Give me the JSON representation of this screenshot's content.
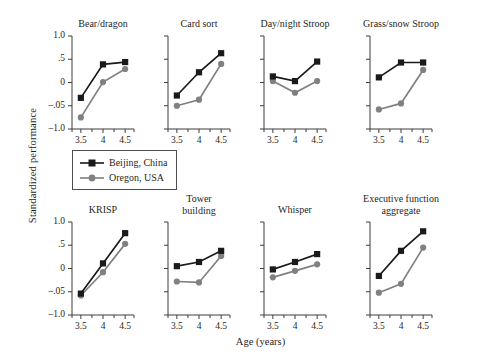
{
  "chart_data": {
    "type": "line",
    "title": "",
    "xlabel": "Age (years)",
    "ylabel": "Standardized performance",
    "x": [
      3.5,
      4,
      4.5
    ],
    "xtick_labels": [
      "3.5",
      "4",
      "4.5"
    ],
    "ytick_labels": [
      "1.0",
      ".5",
      "0",
      "–.05",
      "–1.0"
    ],
    "ytick_values": [
      1.0,
      0.5,
      0,
      -0.5,
      -1.0
    ],
    "ylim": [
      -1.0,
      1.0
    ],
    "xlim": [
      3.3,
      4.7
    ],
    "grid": false,
    "legend_position": "center-left",
    "series_names": [
      "Beijing, China",
      "Oregon, USA"
    ],
    "colors": {
      "beijing": "#1a1a1a",
      "oregon": "#808080",
      "axis": "#3d3d3d",
      "background": "#ffffff"
    },
    "markers": {
      "beijing": "square",
      "oregon": "circle"
    },
    "panels": [
      {
        "title": "Bear/dragon",
        "title_lines": [
          "Bear/dragon"
        ],
        "series": [
          {
            "name": "Beijing, China",
            "values": [
              -0.33,
              0.39,
              0.44
            ]
          },
          {
            "name": "Oregon, USA",
            "values": [
              -0.75,
              0.01,
              0.29
            ]
          }
        ]
      },
      {
        "title": "Card sort",
        "title_lines": [
          "Card sort"
        ],
        "series": [
          {
            "name": "Beijing, China",
            "values": [
              -0.28,
              0.22,
              0.63
            ]
          },
          {
            "name": "Oregon, USA",
            "values": [
              -0.5,
              -0.37,
              0.4
            ]
          }
        ]
      },
      {
        "title": "Day/night Stroop",
        "title_lines": [
          "Day/night Stroop"
        ],
        "series": [
          {
            "name": "Beijing, China",
            "values": [
              0.13,
              0.03,
              0.45
            ]
          },
          {
            "name": "Oregon, USA",
            "values": [
              0.03,
              -0.22,
              0.03
            ]
          }
        ]
      },
      {
        "title": "Grass/snow Stroop",
        "title_lines": [
          "Grass/snow Stroop"
        ],
        "series": [
          {
            "name": "Beijing, China",
            "values": [
              0.11,
              0.43,
              0.43
            ]
          },
          {
            "name": "Oregon, USA",
            "values": [
              -0.58,
              -0.45,
              0.27
            ]
          }
        ]
      },
      {
        "title": "KRISP",
        "title_lines": [
          "KRISP"
        ],
        "series": [
          {
            "name": "Beijing, China",
            "values": [
              -0.54,
              0.11,
              0.76
            ]
          },
          {
            "name": "Oregon, USA",
            "values": [
              -0.58,
              -0.08,
              0.53
            ]
          }
        ]
      },
      {
        "title": "Tower building",
        "title_lines": [
          "Tower",
          "building"
        ],
        "series": [
          {
            "name": "Beijing, China",
            "values": [
              0.05,
              0.14,
              0.38
            ]
          },
          {
            "name": "Oregon, USA",
            "values": [
              -0.28,
              -0.3,
              0.27
            ]
          }
        ]
      },
      {
        "title": "Whisper",
        "title_lines": [
          "Whisper"
        ],
        "series": [
          {
            "name": "Beijing, China",
            "values": [
              -0.02,
              0.14,
              0.31
            ]
          },
          {
            "name": "Oregon, USA",
            "values": [
              -0.19,
              -0.05,
              0.09
            ]
          }
        ]
      },
      {
        "title": "Executive function aggregate",
        "title_lines": [
          "Executive function",
          "aggregate"
        ],
        "series": [
          {
            "name": "Beijing, China",
            "values": [
              -0.16,
              0.38,
              0.8
            ]
          },
          {
            "name": "Oregon, USA",
            "values": [
              -0.52,
              -0.33,
              0.45
            ]
          }
        ]
      }
    ]
  },
  "legend": {
    "items": [
      {
        "label": "Beijing, China",
        "marker": "square",
        "color": "#1a1a1a"
      },
      {
        "label": "Oregon, USA",
        "marker": "circle",
        "color": "#808080"
      }
    ]
  }
}
